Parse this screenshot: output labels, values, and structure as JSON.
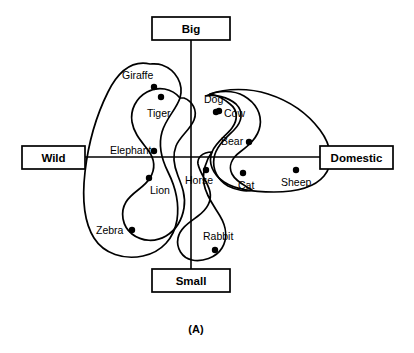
{
  "figure": {
    "caption": "(A)",
    "type": "concept-map-2d-axes"
  },
  "axes": {
    "vertical": {
      "top_label": "Big",
      "bottom_label": "Small",
      "x": 191,
      "y_top": 39,
      "y_bottom": 269
    },
    "horizontal": {
      "left_label": "Wild",
      "right_label": "Domestic",
      "y": 157,
      "x_left": 85,
      "x_right": 320
    }
  },
  "pole_boxes": [
    {
      "name": "big",
      "label": "Big",
      "x": 152,
      "y": 17,
      "w": 78,
      "h": 23
    },
    {
      "name": "small",
      "label": "Small",
      "x": 152,
      "y": 269,
      "w": 78,
      "h": 23
    },
    {
      "name": "wild",
      "label": "Wild",
      "x": 22,
      "y": 146,
      "w": 63,
      "h": 23
    },
    {
      "name": "domestic",
      "label": "Domestic",
      "x": 320,
      "y": 146,
      "w": 73,
      "h": 23
    }
  ],
  "nodes": [
    {
      "name": "giraffe",
      "label": "Giraffe",
      "dot_x": 154,
      "dot_y": 87,
      "label_x": 122,
      "label_y": 79,
      "label_anchor": "start"
    },
    {
      "name": "tiger",
      "label": "Tiger",
      "dot_x": 161,
      "dot_y": 97,
      "label_x": 147,
      "label_y": 117,
      "label_anchor": "start"
    },
    {
      "name": "dog",
      "label": "Dog",
      "dot_x": 219,
      "dot_y": 111,
      "label_x": 204,
      "label_y": 103,
      "label_anchor": "start"
    },
    {
      "name": "cow",
      "label": "Cow",
      "dot_x": 216,
      "dot_y": 112,
      "label_x": 224,
      "label_y": 117,
      "label_anchor": "start"
    },
    {
      "name": "bear",
      "label": "Bear",
      "dot_x": 249,
      "dot_y": 142,
      "label_x": 221,
      "label_y": 145,
      "label_anchor": "start"
    },
    {
      "name": "elephant",
      "label": "Elephant",
      "dot_x": 154,
      "dot_y": 151,
      "label_x": 110,
      "label_y": 154,
      "label_anchor": "start"
    },
    {
      "name": "lion",
      "label": "Lion",
      "dot_x": 149,
      "dot_y": 178,
      "label_x": 150,
      "label_y": 194,
      "label_anchor": "start"
    },
    {
      "name": "horse",
      "label": "Horse",
      "dot_x": 206,
      "dot_y": 170,
      "label_x": 185,
      "label_y": 184,
      "label_anchor": "start"
    },
    {
      "name": "cat",
      "label": "Cat",
      "dot_x": 243,
      "dot_y": 173,
      "label_x": 238,
      "label_y": 189,
      "label_anchor": "start"
    },
    {
      "name": "sheep",
      "label": "Sheep",
      "dot_x": 296,
      "dot_y": 170,
      "label_x": 281,
      "label_y": 186,
      "label_anchor": "start"
    },
    {
      "name": "zebra",
      "label": "Zebra",
      "dot_x": 132,
      "dot_y": 230,
      "label_x": 96,
      "label_y": 234,
      "label_anchor": "start"
    },
    {
      "name": "rabbit",
      "label": "Rabbit",
      "dot_x": 215,
      "dot_y": 250,
      "label_x": 203,
      "label_y": 240,
      "label_anchor": "start"
    }
  ],
  "regions": [
    {
      "name": "wild-big-outer-region",
      "members": [
        "Giraffe",
        "Tiger",
        "Elephant",
        "Lion",
        "Zebra"
      ],
      "path": "M 150 64 C 132 60 118 72 108 92 C 96 116 88 146 85 172 C 82 198 84 222 94 238 C 104 254 124 260 143 256 C 162 252 174 238 177 220 C 180 200 174 184 168 172 C 162 160 158 146 162 132 C 166 118 176 110 180 98 C 184 84 176 70 162 65 C 158 63.5 154 64 150 64 Z"
    },
    {
      "name": "wild-predator-inner-region",
      "members": [
        "Tiger",
        "Lion"
      ],
      "path": "M 180 98 C 172 88 158 86 147 92 C 136 98 130 110 132 122 C 134 134 142 142 148 150 C 154 158 156 168 150 178 C 144 188 132 192 126 202 C 120 212 122 226 132 234 C 142 242 156 242 166 236 C 176 230 182 220 184 208 C 186 196 182 186 178 176 C 174 166 172 156 176 146 C 180 136 190 130 194 120 C 198 110 192 101 184 98 Z"
    },
    {
      "name": "domestic-outer-region",
      "members": [
        "Dog",
        "Cow",
        "Bear",
        "Cat",
        "Sheep"
      ],
      "path": "M 210 94 C 226 88 250 88 268 94 C 290 101 308 114 320 130 C 332 146 334 164 324 176 C 314 188 294 192 274 192 C 254 192 236 190 224 182 C 212 174 208 162 212 152 C 216 142 226 136 232 128 C 238 120 238 110 230 104 C 224 99 216 95 210 94 Z"
    },
    {
      "name": "domestic-big-inner-region",
      "members": [
        "Dog",
        "Cow",
        "Bear"
      ],
      "path": "M 206 96 C 218 90 234 90 244 96 C 256 103 262 114 260 126 C 258 138 248 146 240 152 C 232 158 228 166 232 174 C 236 182 246 186 252 190 C 246 192 236 190 228 186 C 218 180 212 170 214 158 C 216 146 226 138 234 130 C 242 122 244 112 236 104 C 228 97 214 94 206 96 Z"
    },
    {
      "name": "small-region",
      "members": [
        "Horse",
        "Rabbit"
      ],
      "path": "M 212 152 C 206 160 202 172 204 184 C 206 196 214 206 220 216 C 226 226 228 238 222 248 C 216 258 202 262 192 260 C 182 258 176 248 178 238 C 180 228 190 222 198 216 C 206 210 212 202 210 192 C 208 182 200 174 198 164 C 197 158 202 152 212 152 Z"
    }
  ]
}
